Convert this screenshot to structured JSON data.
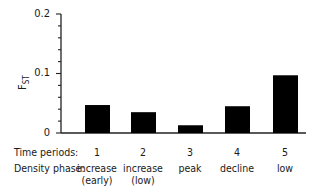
{
  "chart_data": {
    "type": "bar",
    "title": "",
    "xlabel": "",
    "ylabel": "F_ST",
    "ylim": [
      0,
      0.2
    ],
    "yticks": [
      "0",
      "0.1",
      "0.2"
    ],
    "categories": [
      "1",
      "2",
      "3",
      "4",
      "5"
    ],
    "category_rows": [
      {
        "label": "Time periods:",
        "values": [
          "1",
          "2",
          "3",
          "4",
          "5"
        ]
      },
      {
        "label": "Density phase:",
        "values": [
          "increase (early)",
          "increase (low)",
          "peak",
          "decline",
          "low"
        ]
      }
    ],
    "values": [
      0.047,
      0.035,
      0.013,
      0.045,
      0.097
    ],
    "bar_color": "#000000",
    "grid": false,
    "legend": null
  },
  "axis": {
    "y_ticks": [
      {
        "label": "0",
        "value": 0
      },
      {
        "label": "0.1",
        "value": 0.1
      },
      {
        "label": "0.2",
        "value": 0.2
      }
    ],
    "ylabel_main": "F",
    "ylabel_sub": "ST"
  },
  "rows": {
    "time_label": "Time periods:",
    "phase_label": "Density phase:",
    "time": [
      "1",
      "2",
      "3",
      "4",
      "5"
    ],
    "phase_line1": [
      "increase",
      "increase",
      "peak",
      "decline",
      "low"
    ],
    "phase_line2": [
      "(early)",
      "(low)",
      "",
      "",
      ""
    ]
  }
}
